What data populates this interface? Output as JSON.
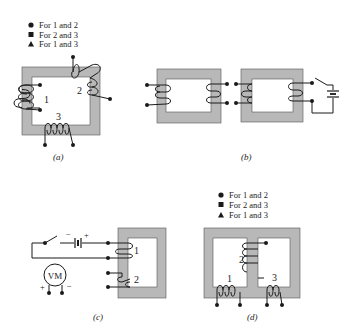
{
  "figure": {
    "panels": [
      {
        "id": "a",
        "caption": "(a)",
        "legend": [
          {
            "marker": "circle",
            "text": "For 1 and 2"
          },
          {
            "marker": "square",
            "text": "For 2 and 3"
          },
          {
            "marker": "triangle",
            "text": "For 1 and 3"
          }
        ],
        "winding_labels": [
          "1",
          "2",
          "3"
        ]
      },
      {
        "id": "b",
        "caption": "(b)"
      },
      {
        "id": "c",
        "caption": "(c)",
        "winding_labels": [
          "1",
          "2"
        ],
        "meter_label": "VM",
        "battery_minus": "−",
        "battery_plus": "+",
        "meter_plus": "+",
        "meter_minus": "−"
      },
      {
        "id": "d",
        "caption": "(d)",
        "legend": [
          {
            "marker": "circle",
            "text": "For 1 and 2"
          },
          {
            "marker": "square",
            "text": "For 2 and 3"
          },
          {
            "marker": "triangle",
            "text": "For 1 and 3"
          }
        ],
        "winding_labels": [
          "1",
          "2",
          "3"
        ]
      }
    ],
    "colors": {
      "core": "#b8b8b8",
      "line": "#1a1a1a",
      "background": "#ffffff"
    }
  }
}
